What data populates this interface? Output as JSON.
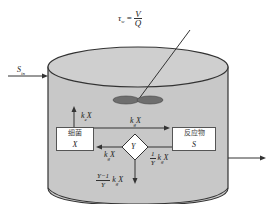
{
  "formula": {
    "lhs": "τ",
    "lhs_sub": "w",
    "eq": " = ",
    "numerator": "V",
    "denominator": "Q"
  },
  "inflow": {
    "label": "S",
    "label_sub": "in"
  },
  "boxes": {
    "bacteria": {
      "name": "细菌",
      "symbol": "X"
    },
    "reactant": {
      "name": "反应物",
      "symbol": "S"
    },
    "yield": {
      "symbol": "Y"
    }
  },
  "rates": {
    "death": {
      "k": "k",
      "sub": "e",
      "var": "X"
    },
    "growth_top": {
      "k": "k",
      "sub": "g",
      "var": "X"
    },
    "growth_left": {
      "k": "k",
      "sub": "g",
      "var": "X"
    },
    "consumption": {
      "num": "1",
      "den": "Y",
      "k": "k",
      "sub": "g",
      "var": "X"
    },
    "byproduct": {
      "num": "Y−1",
      "den": "Y",
      "k": "k",
      "sub": "g",
      "var": "X"
    }
  },
  "colors": {
    "tank_fill": "#c8c8c8",
    "tank_top": "#cfcfcf",
    "stroke": "#333333",
    "impeller": "#6e6e6e"
  }
}
